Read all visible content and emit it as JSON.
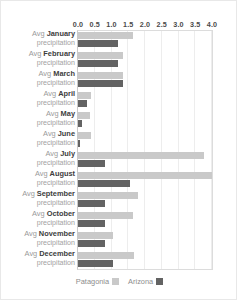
{
  "chart_data": {
    "type": "bar",
    "orientation": "horizontal",
    "title": "",
    "xlabel": "",
    "ylabel": "",
    "xlim": [
      0.0,
      4.0
    ],
    "xticks": [
      "0.0",
      "0.5",
      "1.0",
      "1.5",
      "2.0",
      "2.5",
      "3.0",
      "3.5",
      "4.0"
    ],
    "xtick_values": [
      0.0,
      0.5,
      1.0,
      1.5,
      2.0,
      2.5,
      3.0,
      3.5,
      4.0
    ],
    "grid": true,
    "legend_position": "bottom-center",
    "categories": [
      "Avg January precipitation",
      "Avg February precipitation",
      "Avg March precipitation",
      "Avg April precipitation",
      "Avg May precipitation",
      "Avg June precipitation",
      "Avg July precipitation",
      "Avg August precipitation",
      "Avg September precipitation",
      "Avg October precipitation",
      "Avg November precipitation",
      "Avg December precipitation"
    ],
    "series": [
      {
        "name": "Patagonia",
        "color": "#c9c9c9",
        "values": [
          1.65,
          1.35,
          1.35,
          0.4,
          0.35,
          0.38,
          3.75,
          4.0,
          1.8,
          1.65,
          1.05,
          1.68
        ]
      },
      {
        "name": "Arizona",
        "color": "#636363",
        "values": [
          1.2,
          1.2,
          1.35,
          0.26,
          0.12,
          0.06,
          0.8,
          1.55,
          0.82,
          0.82,
          0.82,
          1.05
        ]
      }
    ]
  },
  "rows": [
    {
      "prefix": "Avg",
      "month": "January",
      "suffix": "precipitation"
    },
    {
      "prefix": "Avg",
      "month": "February",
      "suffix": "precipitation"
    },
    {
      "prefix": "Avg",
      "month": "March",
      "suffix": "precipitation"
    },
    {
      "prefix": "Avg",
      "month": "April",
      "suffix": "precipitation"
    },
    {
      "prefix": "Avg",
      "month": "May",
      "suffix": "precipitation"
    },
    {
      "prefix": "Avg",
      "month": "June",
      "suffix": "precipitation"
    },
    {
      "prefix": "Avg",
      "month": "July",
      "suffix": "precipitation"
    },
    {
      "prefix": "Avg",
      "month": "August",
      "suffix": "precipitation"
    },
    {
      "prefix": "Avg",
      "month": "September",
      "suffix": "precipitation"
    },
    {
      "prefix": "Avg",
      "month": "October",
      "suffix": "precipitation"
    },
    {
      "prefix": "Avg",
      "month": "November",
      "suffix": "precipitation"
    },
    {
      "prefix": "Avg",
      "month": "December",
      "suffix": "precipitation"
    }
  ],
  "legend": [
    {
      "label": "Patagonia",
      "color": "#c9c9c9"
    },
    {
      "label": "Arizona",
      "color": "#636363"
    }
  ]
}
